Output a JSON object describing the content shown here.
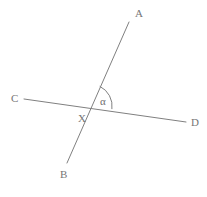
{
  "figure": {
    "title": "",
    "width": 207,
    "height": 197,
    "background_color": "#ffffff",
    "stroke_color": "#808080",
    "label_color": "#767676",
    "stroke_width": 1
  },
  "labels": {
    "a": "A",
    "b": "B",
    "c": "C",
    "d": "D",
    "x": "X",
    "alpha": "α"
  },
  "chart_data": {
    "type": "diagram",
    "subtype": "two-intersecting-lines-with-marked-angle",
    "title": "",
    "xlabel": "",
    "ylabel": "",
    "grid": false,
    "legend": false,
    "points": [
      {
        "name": "A",
        "x": 129,
        "y": 22,
        "label": "A",
        "label_x": 135,
        "label_y": 8
      },
      {
        "name": "B",
        "x": 67,
        "y": 163,
        "label": "B",
        "label_x": 60,
        "label_y": 169
      },
      {
        "name": "C",
        "x": 24,
        "y": 99,
        "label": "C",
        "label_x": 11,
        "label_y": 93
      },
      {
        "name": "D",
        "x": 186,
        "y": 122,
        "label": "D",
        "label_x": 191,
        "label_y": 117
      },
      {
        "name": "X",
        "x": 90,
        "y": 106,
        "label": "X",
        "label_x": 78,
        "label_y": 113
      }
    ],
    "segments": [
      {
        "name": "line-AB",
        "from": "A",
        "to": "B",
        "x1": 129,
        "y1": 22,
        "x2": 67,
        "y2": 163,
        "color": "#808080",
        "width": 1
      },
      {
        "name": "line-CD",
        "from": "C",
        "to": "D",
        "x1": 24,
        "y1": 99,
        "x2": 186,
        "y2": 122,
        "color": "#808080",
        "width": 1
      }
    ],
    "angles": [
      {
        "name": "alpha",
        "symbol": "α",
        "vertex": "X",
        "vertex_x": 90,
        "vertex_y": 106,
        "ray_start": "A",
        "ray_end": "D",
        "radius": 22,
        "arc_path": "M 99.7 86.3 A 22 22 0 0 1 111.9 109.1",
        "label_x": 100,
        "label_y": 96,
        "color": "#808080"
      }
    ],
    "annotations": [
      {
        "text": "α",
        "x": 105,
        "y": 102,
        "role": "angle-measure-symbol"
      }
    ]
  }
}
